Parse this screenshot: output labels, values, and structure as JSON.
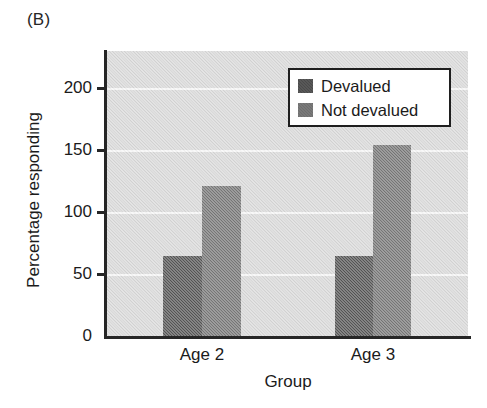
{
  "panel": {
    "label": "(B)"
  },
  "colors": {
    "plot_background": "#d9d9d9",
    "gridline": "#f7f7f7",
    "axis": "#262626",
    "devalued": "#4a4a4a",
    "not_devalued": "#6e6e6e",
    "legend_background": "#ffffff",
    "legend_border": "#1f1f1f",
    "text": "#1b1b1b"
  },
  "chart_data": {
    "type": "bar",
    "title": "(B)",
    "xlabel": "Group",
    "ylabel": "Percentage responding",
    "categories": [
      "Age 2",
      "Age 3"
    ],
    "series": [
      {
        "name": "Devalued",
        "values": [
          65,
          65
        ],
        "color": "#4a4a4a"
      },
      {
        "name": "Not devalued",
        "values": [
          121,
          154
        ],
        "color": "#6e6e6e"
      }
    ],
    "ylim": [
      0,
      225
    ],
    "yticks": [
      0,
      50,
      100,
      150,
      200
    ],
    "ytick_labels": [
      "0",
      "50",
      "100",
      "150",
      "200"
    ],
    "grid": true,
    "grid_axis": "y",
    "legend_position": "upper right",
    "legend_entries": [
      "Devalued",
      "Not devalued"
    ]
  },
  "axes": {
    "y_title": "Percentage responding",
    "x_title": "Group",
    "y_ticks": [
      {
        "label": "200",
        "value": 200
      },
      {
        "label": "150",
        "value": 150
      },
      {
        "label": "100",
        "value": 100
      },
      {
        "label": "50",
        "value": 50
      },
      {
        "label": "0",
        "value": 0
      }
    ],
    "x_ticks": [
      {
        "label": "Age 2"
      },
      {
        "label": "Age 3"
      }
    ]
  },
  "legend": {
    "items": [
      {
        "label": "Devalued",
        "color": "#4a4a4a"
      },
      {
        "label": "Not devalued",
        "color": "#6e6e6e"
      }
    ]
  },
  "bars": [
    {
      "group": "Age 2",
      "series": "Devalued",
      "value": 65,
      "color": "#4a4a4a",
      "x": 56,
      "width": 39
    },
    {
      "group": "Age 2",
      "series": "Not devalued",
      "value": 121,
      "color": "#6e6e6e",
      "x": 95,
      "width": 39
    },
    {
      "group": "Age 3",
      "series": "Devalued",
      "value": 65,
      "color": "#4a4a4a",
      "x": 228,
      "width": 38
    },
    {
      "group": "Age 3",
      "series": "Not devalued",
      "value": 154,
      "color": "#6e6e6e",
      "x": 266,
      "width": 38
    }
  ],
  "geometry": {
    "plot_left": 107,
    "plot_top": 51,
    "plot_width": 361,
    "plot_height": 285,
    "baseline_y": 336,
    "pixels_per_unit": 1.2381
  }
}
